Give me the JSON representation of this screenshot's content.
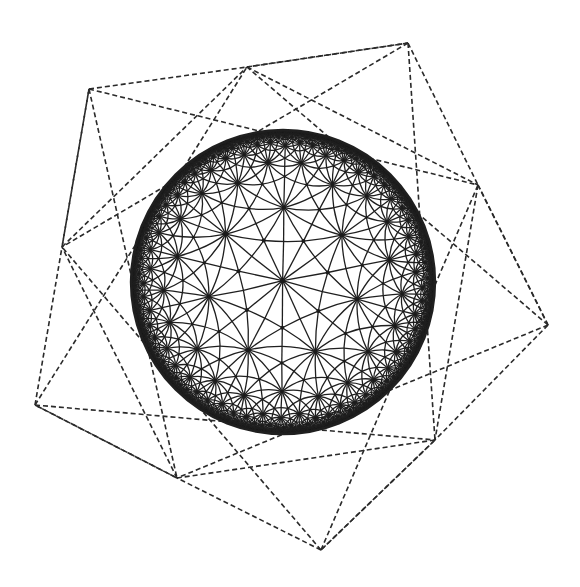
{
  "figure": {
    "colors": {
      "ink": "#1f1f1f",
      "dash_ink": "#2a2a2a",
      "background": "#ffffff"
    },
    "disk": {
      "cx": 283,
      "cy": 282,
      "r": 152,
      "center_node": [
        283,
        282
      ],
      "rotation_deg": -12
    },
    "tiling": {
      "p": 7,
      "q": 3,
      "depth": 6
    },
    "outer_net": {
      "tips": [
        [
          408,
          43
        ],
        [
          548,
          325
        ],
        [
          321,
          550
        ],
        [
          35,
          405
        ],
        [
          89,
          89
        ]
      ],
      "mids": [
        [
          478,
          185
        ],
        [
          435,
          440
        ],
        [
          177,
          478
        ],
        [
          62,
          247
        ],
        [
          247,
          67
        ]
      ]
    }
  }
}
